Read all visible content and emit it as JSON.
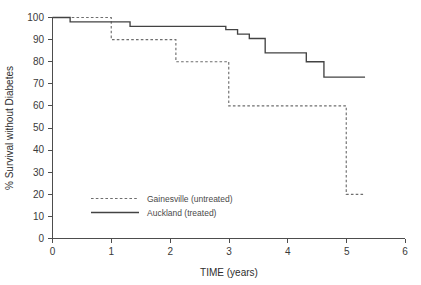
{
  "chart_data": {
    "type": "line",
    "title": "",
    "xlabel": "TIME (years)",
    "ylabel": "% Survival without  Diabetes",
    "xlim": [
      0,
      6
    ],
    "ylim": [
      0,
      100
    ],
    "xticks": [
      "0",
      "1",
      "2",
      "3",
      "4",
      "5",
      "6"
    ],
    "yticks": [
      "0",
      "10",
      "20",
      "30",
      "40",
      "50",
      "60",
      "70",
      "80",
      "90",
      "100"
    ],
    "grid": false,
    "legend_position": "lower-left-inside",
    "series": [
      {
        "name": "Gainesville (untreated)",
        "style": "dashed",
        "color": "#6e6e6e",
        "steps": [
          {
            "x": 0.0,
            "y": 100
          },
          {
            "x": 1.0,
            "y": 100
          },
          {
            "x": 1.0,
            "y": 90
          },
          {
            "x": 2.1,
            "y": 90
          },
          {
            "x": 2.1,
            "y": 80
          },
          {
            "x": 3.0,
            "y": 80
          },
          {
            "x": 3.0,
            "y": 60
          },
          {
            "x": 5.0,
            "y": 60
          },
          {
            "x": 5.0,
            "y": 20
          },
          {
            "x": 5.3,
            "y": 20
          }
        ]
      },
      {
        "name": "Auckland (treated)",
        "style": "solid",
        "color": "#434343",
        "steps": [
          {
            "x": 0.0,
            "y": 100
          },
          {
            "x": 0.3,
            "y": 100
          },
          {
            "x": 0.3,
            "y": 98
          },
          {
            "x": 1.32,
            "y": 98
          },
          {
            "x": 1.32,
            "y": 96
          },
          {
            "x": 2.95,
            "y": 96
          },
          {
            "x": 2.95,
            "y": 94.5
          },
          {
            "x": 3.15,
            "y": 94.5
          },
          {
            "x": 3.15,
            "y": 92.5
          },
          {
            "x": 3.35,
            "y": 92.5
          },
          {
            "x": 3.35,
            "y": 90.5
          },
          {
            "x": 3.62,
            "y": 90.5
          },
          {
            "x": 3.62,
            "y": 84
          },
          {
            "x": 4.32,
            "y": 84
          },
          {
            "x": 4.32,
            "y": 80
          },
          {
            "x": 4.62,
            "y": 80
          },
          {
            "x": 4.62,
            "y": 73
          },
          {
            "x": 5.32,
            "y": 73
          }
        ]
      }
    ]
  },
  "legend": {
    "entries": [
      {
        "label": "Gainesville (untreated)",
        "style": "dashed"
      },
      {
        "label": "Auckland (treated)",
        "style": "solid"
      }
    ]
  }
}
